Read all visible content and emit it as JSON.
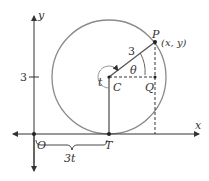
{
  "diagram": {
    "type": "geometry-figure",
    "colors": {
      "axis": "#333333",
      "circle": "#8a8a8a",
      "radius": "#555555",
      "dashed": "#333333"
    },
    "labels": {
      "y_axis": "y",
      "x_axis": "x",
      "origin": "O",
      "y_tick": "3",
      "point_P": "P",
      "point_P_coords": "(x, y)",
      "radius_label": "3",
      "angle_theta": "θ",
      "angle_t": "t",
      "center": "C",
      "point_Q": "Q",
      "point_T": "T",
      "brace_label": "3t"
    }
  }
}
